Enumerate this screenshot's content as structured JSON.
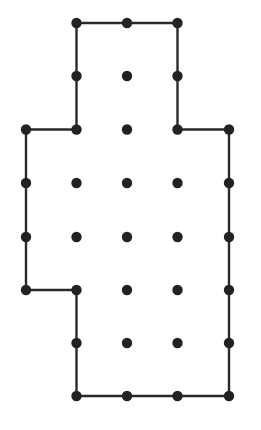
{
  "diagram": {
    "type": "dot-grid-polygon",
    "width": 261,
    "height": 430,
    "colors": {
      "background": "#ffffff",
      "line": "#2a2a2a",
      "dot": "#222222"
    },
    "line_width": 2.4,
    "dot_radius": 5.2,
    "columns_x": [
      26,
      76.5,
      127,
      177.5,
      229
    ],
    "rows_y": [
      23,
      76,
      129.5,
      183,
      237,
      290,
      343,
      396
    ],
    "dots": [
      [
        1,
        0
      ],
      [
        2,
        0
      ],
      [
        3,
        0
      ],
      [
        1,
        1
      ],
      [
        2,
        1
      ],
      [
        3,
        1
      ],
      [
        0,
        2
      ],
      [
        1,
        2
      ],
      [
        2,
        2
      ],
      [
        3,
        2
      ],
      [
        4,
        2
      ],
      [
        0,
        3
      ],
      [
        1,
        3
      ],
      [
        2,
        3
      ],
      [
        3,
        3
      ],
      [
        4,
        3
      ],
      [
        0,
        4
      ],
      [
        1,
        4
      ],
      [
        2,
        4
      ],
      [
        3,
        4
      ],
      [
        4,
        4
      ],
      [
        0,
        5
      ],
      [
        1,
        5
      ],
      [
        2,
        5
      ],
      [
        3,
        5
      ],
      [
        4,
        5
      ],
      [
        1,
        6
      ],
      [
        2,
        6
      ],
      [
        3,
        6
      ],
      [
        4,
        6
      ],
      [
        1,
        7
      ],
      [
        2,
        7
      ],
      [
        3,
        7
      ],
      [
        4,
        7
      ]
    ],
    "polygon": [
      [
        1,
        0
      ],
      [
        3,
        0
      ],
      [
        3,
        2
      ],
      [
        4,
        2
      ],
      [
        4,
        7
      ],
      [
        1,
        7
      ],
      [
        1,
        5
      ],
      [
        0,
        5
      ],
      [
        0,
        2
      ],
      [
        1,
        2
      ],
      [
        1,
        0
      ]
    ]
  }
}
